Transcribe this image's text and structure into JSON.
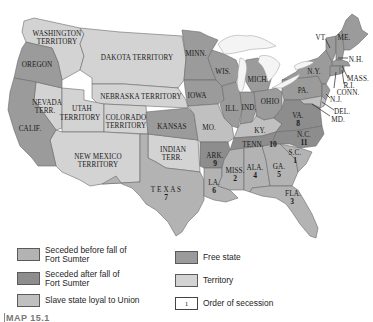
{
  "map": {
    "colors": {
      "seceded_before": "#b3b3b3",
      "seceded_after": "#8d8d8d",
      "slave_loyal": "#c0c0c0",
      "free": "#9b9b9b",
      "territory": "#d3d3d3",
      "water": "#ffffff"
    },
    "regions": {
      "washington": "WASHINGTON",
      "washington2": "TERRITORY",
      "oregon": "OREGON",
      "dakota": "DAKOTA TERRITORY",
      "nebraska": "NEBRASKA TERRITORY",
      "nevada": "NEVADA",
      "nevada2": "TERR.",
      "utah": "UTAH",
      "utah2": "TERRITORY",
      "colorado": "COLORADO",
      "colorado2": "TERRITORY",
      "calif": "CALIF.",
      "newmexico": "NEW MEXICO",
      "newmexico2": "TERRITORY",
      "kansas": "KANSAS",
      "indian": "INDIAN",
      "indian2": "TERR.",
      "texas": "T E X A S",
      "texas_num": "7",
      "minn": "MINN.",
      "iowa": "IOWA",
      "wis": "WIS.",
      "mich": "MICH.",
      "ill": "ILL.",
      "ind": "IND.",
      "ohio": "OHIO",
      "mo": "MO.",
      "ky": "KY.",
      "pa": "PA.",
      "ny": "N.Y.",
      "vt": "VT.",
      "me": "ME.",
      "nh": "N.H.",
      "mass": "MASS.",
      "ri": "R.I.",
      "conn": "CONN.",
      "nj": "N.J.",
      "del": "DEL.",
      "md": "MD.",
      "va": "VA.",
      "va_num": "8",
      "nc": "N.C.",
      "nc_num": "11",
      "tenn": "TENN.",
      "tenn_num": "10",
      "ark": "ARK.",
      "ark_num": "9",
      "la": "LA.",
      "la_num": "6",
      "miss": "MISS.",
      "miss_num": "2",
      "ala": "ALA.",
      "ala_num": "4",
      "ga": "GA.",
      "ga_num": "5",
      "sc": "S.C.",
      "sc_num": "1",
      "fla": "FLA.",
      "fla_num": "3"
    }
  },
  "legend": {
    "items": [
      {
        "label_line1": "Seceded before fall of",
        "label_line2": "Fort Sumter",
        "color": "#b3b3b3"
      },
      {
        "label_line1": "Seceded after fall of",
        "label_line2": "Fort Sumter",
        "color": "#8d8d8d"
      },
      {
        "label_line1": "Slave state loyal to Union",
        "label_line2": "",
        "color": "#c0c0c0"
      },
      {
        "label_line1": "Free state",
        "label_line2": "",
        "color": "#9b9b9b"
      },
      {
        "label_line1": "Territory",
        "label_line2": "",
        "color": "#d3d3d3"
      },
      {
        "label_line1": "Order of secession",
        "label_line2": "",
        "color": "#ffffff",
        "sample_number": "1"
      }
    ]
  },
  "caption": "MAP 15.1"
}
